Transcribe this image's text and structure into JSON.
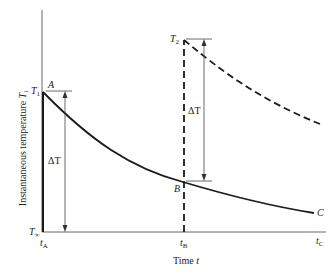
{
  "diagram": {
    "title": "",
    "y_axis_label": "Instantaneous temperature",
    "y_axis_symbol": "T",
    "y_axis_symbol_sub": "i",
    "x_axis_label": "Time",
    "x_axis_symbol": "t",
    "y_ticks": [
      {
        "sym": "T",
        "sub": "1"
      },
      {
        "sym": "T",
        "sub": "∞"
      }
    ],
    "x_ticks": [
      {
        "sym": "t",
        "sub": "A"
      },
      {
        "sym": "t",
        "sub": "B"
      },
      {
        "sym": "t",
        "sub": "C"
      }
    ],
    "points": {
      "A": "A",
      "B": "B",
      "C": "C"
    },
    "t2": {
      "sym": "T",
      "sub": "2"
    },
    "delta_left": "ΔT",
    "delta_right": "ΔT",
    "curves": [
      {
        "name": "solid decay A-B-C",
        "style": "solid"
      },
      {
        "name": "dashed decay from T2",
        "style": "dashed"
      }
    ],
    "colors": {
      "line": "#1a1a1a",
      "axis": "#555555",
      "thin": "#444444"
    }
  }
}
